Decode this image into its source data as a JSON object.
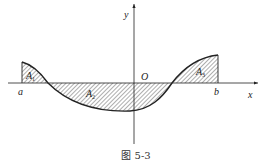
{
  "figure": {
    "caption": "图 5-3",
    "axes": {
      "x_label": "x",
      "y_label": "y",
      "origin_label": "O"
    },
    "points": {
      "a_label": "a",
      "b_label": "b"
    },
    "regions": [
      {
        "name": "A",
        "sub": "1",
        "sign": "positive"
      },
      {
        "name": "A",
        "sub": "2",
        "sign": "negative"
      },
      {
        "name": "A",
        "sub": "3",
        "sign": "positive"
      }
    ],
    "colors": {
      "stroke": "#222222",
      "hatch": "#333333",
      "background": "#ffffff"
    }
  }
}
